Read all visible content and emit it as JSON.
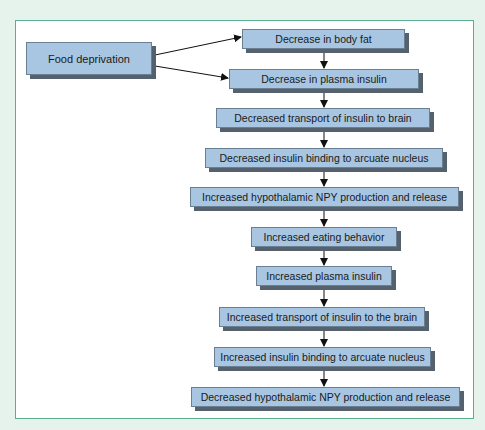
{
  "diagram": {
    "type": "flowchart",
    "source_node": {
      "id": "food",
      "label": "Food deprivation"
    },
    "nodes": [
      {
        "id": "n1",
        "label": "Decrease in body fat"
      },
      {
        "id": "n2",
        "label": "Decrease in plasma insulin"
      },
      {
        "id": "n3",
        "label": "Decreased transport of insulin to brain"
      },
      {
        "id": "n4",
        "label": "Decreased insulin binding to arcuate nucleus"
      },
      {
        "id": "n5",
        "label": "Increased hypothalamic NPY production and release"
      },
      {
        "id": "n6",
        "label": "Increased eating behavior"
      },
      {
        "id": "n7",
        "label": "Increased plasma insulin"
      },
      {
        "id": "n8",
        "label": "Increased transport of insulin to the brain"
      },
      {
        "id": "n9",
        "label": "Increased insulin binding to arcuate nucleus"
      },
      {
        "id": "n10",
        "label": "Decreased hypothalamic NPY production and release"
      }
    ],
    "edges": [
      [
        "food",
        "n1"
      ],
      [
        "food",
        "n2"
      ],
      [
        "n1",
        "n2"
      ],
      [
        "n2",
        "n3"
      ],
      [
        "n3",
        "n4"
      ],
      [
        "n4",
        "n5"
      ],
      [
        "n5",
        "n6"
      ],
      [
        "n6",
        "n7"
      ],
      [
        "n7",
        "n8"
      ],
      [
        "n8",
        "n9"
      ],
      [
        "n9",
        "n10"
      ]
    ],
    "colors": {
      "box_fill": "#a8c6e2",
      "box_shadow": "#55616c",
      "frame_border": "#5aae92",
      "page_background": "#e6f2ec"
    }
  }
}
